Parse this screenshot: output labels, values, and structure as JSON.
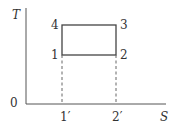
{
  "diagram": {
    "type": "T-S diagram",
    "axes": {
      "y_label": "T",
      "x_label": "S",
      "origin_label": "0"
    },
    "points": {
      "p1": "1",
      "p2": "2",
      "p3": "3",
      "p4": "4"
    },
    "x_ticks": {
      "t1": "1′",
      "t2": "2′"
    },
    "colors": {
      "line": "#444444",
      "dashed": "#666666",
      "text": "#333333"
    }
  }
}
